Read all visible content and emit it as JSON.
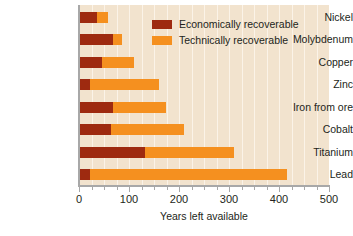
{
  "chart_data": {
    "type": "bar",
    "orientation": "horizontal",
    "stacked": true,
    "title": "",
    "xlabel": "Years left available",
    "ylabel": "",
    "xlim": [
      0,
      500
    ],
    "xticks": [
      0,
      100,
      200,
      300,
      400,
      500
    ],
    "xtick_labels": [
      "0",
      "100",
      "200",
      "300",
      "400",
      "500"
    ],
    "minor_tick_step": 25,
    "grid": true,
    "grid_axis": "x",
    "legend_position": "top-right",
    "categories": [
      "Nickel",
      "Molybdenum",
      "Copper",
      "Zinc",
      "Iron from ore",
      "Cobalt",
      "Titanium",
      "Lead"
    ],
    "series": [
      {
        "name": "Economically recoverable",
        "color": "#9e2a10",
        "values": [
          36,
          68,
          45,
          22,
          68,
          64,
          132,
          22
        ]
      },
      {
        "name": "Technically recoverable",
        "color": "#f5901f",
        "values": [
          57,
          85,
          110,
          160,
          174,
          210,
          310,
          416
        ]
      }
    ]
  },
  "legend": {
    "items": [
      {
        "label": "Economically recoverable",
        "swatch": "dark-red-swatch"
      },
      {
        "label": "Technically recoverable",
        "swatch": "orange-swatch"
      }
    ]
  },
  "colors": {
    "economically_recoverable": "#9e2a10",
    "technically_recoverable": "#f5901f",
    "plot_background": "#f2e3ce",
    "gridline": "#fdf6ec",
    "axis": "#a8a8a8",
    "text": "#231f20"
  }
}
